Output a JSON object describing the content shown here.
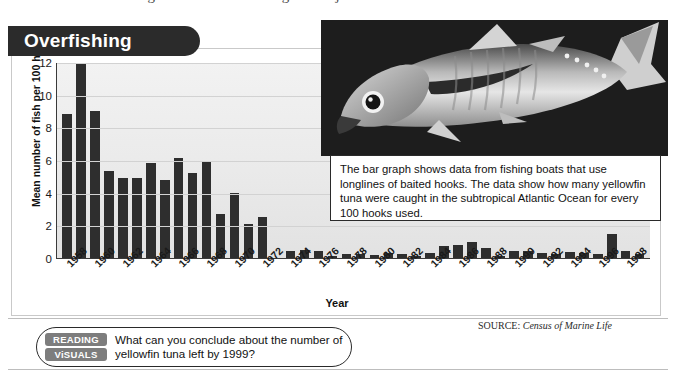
{
  "page": {
    "top_partial_line": "sing Problem: Overfishing is a major threat to ocean environments.",
    "source_prefix": "SOURCE:",
    "source_name": "Census of Marine Life"
  },
  "banner": {
    "title": "Overfishing"
  },
  "callout": {
    "text": "The bar graph shows data from fishing boats that use longlines of baited hooks. The data show how many yellowfin tuna were caught in the subtropical Atlantic Ocean for every 100 hooks used."
  },
  "question_bar": {
    "badge_line1": "READING",
    "badge_line2": "ViSUALS",
    "question": "What can you conclude about the number of yellowfin tuna left by 1999?"
  },
  "photo": {
    "alt_name": "yellowfin-tuna-photo"
  },
  "chart_data": {
    "type": "bar",
    "title": "Overfishing",
    "xlabel": "Year",
    "ylabel": "Mean number of fish per 100 hooks",
    "ylim": [
      0,
      12
    ],
    "yticks": [
      0,
      2,
      4,
      6,
      8,
      10,
      12
    ],
    "grid": true,
    "legend": "none",
    "bar_color": "#2e2e2e",
    "categories": [
      1958,
      1959,
      1960,
      1961,
      1962,
      1963,
      1964,
      1965,
      1966,
      1967,
      1968,
      1969,
      1970,
      1971,
      1972,
      1973,
      1974,
      1975,
      1976,
      1977,
      1978,
      1979,
      1980,
      1981,
      1982,
      1983,
      1984,
      1985,
      1986,
      1987,
      1988,
      1989,
      1990,
      1991,
      1992,
      1993,
      1994,
      1995,
      1996,
      1997,
      1998,
      1999
    ],
    "visible_tick_labels": [
      "1958",
      "1960",
      "1962",
      "1964",
      "1966",
      "1968",
      "1970",
      "1972",
      "1974",
      "1976",
      "1978",
      "1980",
      "1982",
      "1984",
      "1986",
      "1988",
      "1990",
      "1992",
      "1994",
      "1996",
      "1998"
    ],
    "values": [
      8.8,
      11.9,
      9.0,
      5.3,
      4.9,
      4.9,
      5.8,
      4.8,
      6.1,
      5.2,
      5.9,
      2.7,
      4.0,
      2.1,
      2.5,
      0.0,
      0.4,
      0.5,
      0.45,
      0.1,
      0.25,
      0.25,
      0.2,
      0.3,
      0.25,
      0.15,
      0.3,
      0.75,
      0.8,
      0.95,
      0.6,
      0.15,
      0.45,
      0.4,
      0.3,
      0.25,
      0.35,
      0.3,
      0.25,
      1.45,
      0.4,
      0.25
    ]
  }
}
